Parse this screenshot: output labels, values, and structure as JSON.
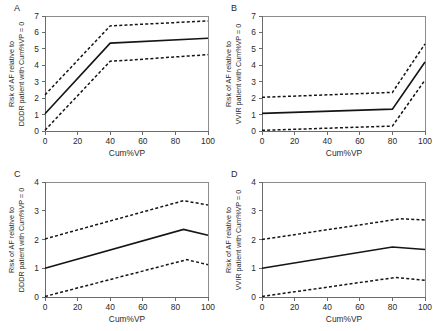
{
  "figure": {
    "title": "",
    "panel_count": 4,
    "background": "#ffffff",
    "line_color": "#151515",
    "axis_color": "#6b6b6b"
  },
  "axis_common": {
    "xlabel": "Cum%VP",
    "xticks": [
      0,
      20,
      40,
      60,
      80,
      100
    ],
    "xlim": [
      0,
      100
    ]
  },
  "panels": {
    "a": {
      "letter": "A",
      "ylabel": "Risk of AF relative to\nDDDR patient with Cum%VP = 0",
      "xlabel": "Cum%VP",
      "yticks": [
        0,
        1,
        2,
        3,
        4,
        5,
        6,
        7
      ],
      "xtick_labels": [
        "0",
        "20",
        "40",
        "60",
        "80",
        "100"
      ]
    },
    "b": {
      "letter": "B",
      "ylabel": "Risk of AF relative to\nVVIR patient with Cum%VP = 0",
      "xlabel": "Cum%VP",
      "yticks": [
        0,
        1,
        2,
        3,
        4,
        5,
        6,
        7
      ],
      "xtick_labels": [
        "0",
        "20",
        "40",
        "60",
        "80",
        "100"
      ]
    },
    "c": {
      "letter": "C",
      "ylabel": "Risk of AF relative to\nDDDR patient with Cum%VP = 0",
      "xlabel": "Cum%VP",
      "yticks": [
        0,
        1,
        2,
        3,
        4
      ],
      "xtick_labels": [
        "0",
        "20",
        "40",
        "60",
        "80",
        "100"
      ]
    },
    "d": {
      "letter": "D",
      "ylabel": "Risk of AF relative to\nVVIR patient with Cum%VP = 0",
      "xlabel": "Cum%VP",
      "yticks": [
        0,
        1,
        2,
        3,
        4
      ],
      "xtick_labels": [
        "0",
        "20",
        "40",
        "60",
        "80",
        "100"
      ]
    }
  },
  "chart_data": [
    {
      "panel": "A",
      "type": "line",
      "title": "A",
      "xlabel": "Cum%VP",
      "ylabel": "Risk of AF relative to DDDR patient with Cum%VP = 0",
      "xlim": [
        0,
        100
      ],
      "ylim": [
        0,
        7
      ],
      "xticks": [
        0,
        20,
        40,
        60,
        80,
        100
      ],
      "yticks": [
        0,
        1,
        2,
        3,
        4,
        5,
        6,
        7
      ],
      "grid": false,
      "legend": "none",
      "series": [
        {
          "name": "Hazard ratio estimate",
          "style": "solid",
          "x": [
            0,
            40,
            100
          ],
          "values": [
            1.05,
            5.35,
            5.65
          ]
        },
        {
          "name": "Upper 95% confidence limit",
          "style": "dashed",
          "x": [
            0,
            40,
            50,
            100
          ],
          "values": [
            2.2,
            6.4,
            6.45,
            6.7
          ]
        },
        {
          "name": "Lower 95% confidence limit",
          "style": "dashed",
          "x": [
            0,
            40,
            50,
            100
          ],
          "values": [
            0.05,
            4.25,
            4.3,
            4.65
          ]
        }
      ]
    },
    {
      "panel": "B",
      "type": "line",
      "title": "B",
      "xlabel": "Cum%VP",
      "ylabel": "Risk of AF relative to VVIR patient with Cum%VP = 0",
      "xlim": [
        0,
        100
      ],
      "ylim": [
        0,
        7
      ],
      "xticks": [
        0,
        20,
        40,
        60,
        80,
        100
      ],
      "yticks": [
        0,
        1,
        2,
        3,
        4,
        5,
        6,
        7
      ],
      "grid": false,
      "legend": "none",
      "series": [
        {
          "name": "Hazard ratio estimate",
          "style": "solid",
          "x": [
            0,
            80,
            100
          ],
          "values": [
            1.07,
            1.33,
            4.2
          ]
        },
        {
          "name": "Upper 95% confidence limit",
          "style": "dashed",
          "x": [
            0,
            80,
            100
          ],
          "values": [
            2.05,
            2.35,
            5.3
          ]
        },
        {
          "name": "Lower 95% confidence limit",
          "style": "dashed",
          "x": [
            0,
            80,
            100
          ],
          "values": [
            0.04,
            0.3,
            3.1
          ]
        }
      ]
    },
    {
      "panel": "C",
      "type": "line",
      "title": "C",
      "xlabel": "Cum%VP",
      "ylabel": "Risk of AF relative to DDDR patient with Cum%VP = 0",
      "xlim": [
        0,
        100
      ],
      "ylim": [
        0,
        4
      ],
      "xticks": [
        0,
        20,
        40,
        60,
        80,
        100
      ],
      "yticks": [
        0,
        1,
        2,
        3,
        4
      ],
      "grid": false,
      "legend": "none",
      "series": [
        {
          "name": "Hazard ratio estimate",
          "style": "solid",
          "x": [
            0,
            85,
            100
          ],
          "values": [
            1.0,
            2.35,
            2.15
          ]
        },
        {
          "name": "Upper 95% confidence limit",
          "style": "dashed",
          "x": [
            0,
            85,
            100
          ],
          "values": [
            2.02,
            3.35,
            3.2
          ]
        },
        {
          "name": "Lower 95% confidence limit",
          "style": "dashed",
          "x": [
            0,
            87,
            100
          ],
          "values": [
            0.02,
            1.3,
            1.12
          ]
        }
      ]
    },
    {
      "panel": "D",
      "type": "line",
      "title": "D",
      "xlabel": "Cum%VP",
      "ylabel": "Risk of AF relative to VVIR patient with Cum%VP = 0",
      "xlim": [
        0,
        100
      ],
      "ylim": [
        0,
        4
      ],
      "xticks": [
        0,
        20,
        40,
        60,
        80,
        100
      ],
      "yticks": [
        0,
        1,
        2,
        3,
        4
      ],
      "grid": false,
      "legend": "none",
      "series": [
        {
          "name": "Hazard ratio estimate",
          "style": "solid",
          "x": [
            0,
            80,
            100
          ],
          "values": [
            1.0,
            1.74,
            1.65
          ]
        },
        {
          "name": "Upper 95% confidence limit",
          "style": "dashed",
          "x": [
            0,
            85,
            100
          ],
          "values": [
            2.0,
            2.72,
            2.68
          ]
        },
        {
          "name": "Lower 95% confidence limit",
          "style": "dashed",
          "x": [
            0,
            82,
            100
          ],
          "values": [
            0.02,
            0.68,
            0.58
          ]
        }
      ]
    }
  ]
}
